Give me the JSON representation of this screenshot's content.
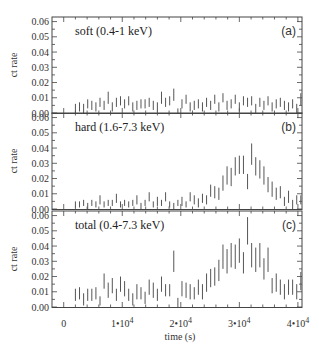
{
  "chart_data": {
    "type": "scatter",
    "style": "errorbar-lightcurve",
    "xlabel": "time (s)",
    "ylabel": "ct rate",
    "xlim": [
      -2000,
      40700
    ],
    "ylim": [
      0.0,
      0.063
    ],
    "x_ticks": [
      {
        "value": 0,
        "label": "0"
      },
      {
        "value": 10000,
        "label": "1•10",
        "exp": "4"
      },
      {
        "value": 20000,
        "label": "2•10",
        "exp": "4"
      },
      {
        "value": 30000,
        "label": "3•10",
        "exp": "4"
      },
      {
        "value": 40000,
        "label": "4•10",
        "exp": "4"
      }
    ],
    "y_ticks": [
      "0.00",
      "0.01",
      "0.02",
      "0.03",
      "0.04",
      "0.05",
      "0.06"
    ],
    "grid": false,
    "panels": [
      {
        "id": "a",
        "tag": "(a)",
        "title": "soft (0.4-1 keV)",
        "x": [
          2000,
          2700,
          3400,
          4100,
          4800,
          5500,
          6200,
          6900,
          7600,
          8300,
          9000,
          9700,
          10400,
          11100,
          11800,
          12500,
          13200,
          13900,
          14600,
          15300,
          16000,
          16700,
          17400,
          18100,
          18800,
          19500,
          20200,
          20900,
          21600,
          22300,
          23000,
          23700,
          24400,
          25100,
          25800,
          26500,
          27200,
          27900,
          28600,
          29300,
          30000,
          30700,
          31400,
          32100,
          32800,
          33500,
          34200,
          34900,
          35600,
          36300,
          37000,
          37700,
          38400,
          39100,
          39800,
          40500
        ],
        "y": [
          0.003,
          0.004,
          0.003,
          0.006,
          0.005,
          0.004,
          0.007,
          0.005,
          0.01,
          0.004,
          0.007,
          0.008,
          0.006,
          0.008,
          0.004,
          0.005,
          0.006,
          0.006,
          0.007,
          0.005,
          0.004,
          0.01,
          0.007,
          0.008,
          0.012,
          0.001,
          0.006,
          0.009,
          0.004,
          0.005,
          0.006,
          0.004,
          0.007,
          0.005,
          0.009,
          0.004,
          0.01,
          0.005,
          0.006,
          0.009,
          0.004,
          0.008,
          0.007,
          0.008,
          0.003,
          0.007,
          0.005,
          0.008,
          0.004,
          0.006,
          0.007,
          0.005,
          0.004,
          0.006,
          0.003,
          0.009
        ],
        "err": [
          0.003,
          0.003,
          0.003,
          0.003,
          0.003,
          0.003,
          0.003,
          0.003,
          0.004,
          0.003,
          0.003,
          0.003,
          0.003,
          0.003,
          0.003,
          0.003,
          0.003,
          0.003,
          0.003,
          0.003,
          0.003,
          0.004,
          0.003,
          0.003,
          0.004,
          0.002,
          0.003,
          0.003,
          0.003,
          0.003,
          0.003,
          0.003,
          0.003,
          0.003,
          0.003,
          0.003,
          0.003,
          0.003,
          0.003,
          0.003,
          0.003,
          0.003,
          0.003,
          0.003,
          0.003,
          0.003,
          0.003,
          0.003,
          0.003,
          0.003,
          0.003,
          0.003,
          0.003,
          0.003,
          0.003,
          0.004
        ]
      },
      {
        "id": "b",
        "tag": "(b)",
        "title": "hard (1.6-7.3 keV)",
        "x": [
          2000,
          2700,
          3400,
          4100,
          4800,
          5500,
          6200,
          6900,
          7600,
          8300,
          9000,
          9700,
          10400,
          11100,
          11800,
          12500,
          13200,
          13900,
          14600,
          15300,
          16000,
          16700,
          17400,
          18100,
          18800,
          19500,
          20200,
          20900,
          21600,
          22300,
          23000,
          23700,
          24400,
          25100,
          25800,
          26500,
          27200,
          27900,
          28600,
          29300,
          30000,
          30700,
          31400,
          32100,
          32800,
          33500,
          34200,
          34900,
          35600,
          36300,
          37000,
          37700,
          38400,
          39100,
          39800,
          40500
        ],
        "y": [
          0.003,
          0.003,
          0.004,
          0.002,
          0.004,
          0.003,
          0.006,
          0.003,
          0.004,
          0.004,
          0.007,
          0.003,
          0.004,
          0.003,
          0.004,
          0.006,
          0.002,
          0.004,
          0.008,
          0.003,
          0.005,
          0.004,
          0.008,
          0.003,
          0.002,
          0.004,
          0.005,
          0.003,
          0.008,
          0.006,
          0.004,
          0.007,
          0.006,
          0.012,
          0.011,
          0.01,
          0.017,
          0.022,
          0.021,
          0.028,
          0.029,
          0.029,
          0.018,
          0.036,
          0.028,
          0.026,
          0.022,
          0.016,
          0.013,
          0.01,
          0.011,
          0.005,
          0.008,
          0.003,
          0.006,
          0.006
        ],
        "err": [
          0.002,
          0.002,
          0.002,
          0.002,
          0.002,
          0.002,
          0.003,
          0.002,
          0.002,
          0.002,
          0.003,
          0.002,
          0.002,
          0.002,
          0.002,
          0.003,
          0.002,
          0.002,
          0.003,
          0.002,
          0.003,
          0.002,
          0.003,
          0.002,
          0.002,
          0.002,
          0.003,
          0.002,
          0.003,
          0.003,
          0.003,
          0.003,
          0.003,
          0.004,
          0.004,
          0.004,
          0.005,
          0.006,
          0.006,
          0.006,
          0.006,
          0.006,
          0.005,
          0.007,
          0.006,
          0.006,
          0.006,
          0.005,
          0.005,
          0.004,
          0.004,
          0.003,
          0.004,
          0.003,
          0.003,
          0.003
        ]
      },
      {
        "id": "c",
        "tag": "(c)",
        "title": "total (0.4-7.3 keV)",
        "x": [
          2000,
          2700,
          3400,
          4100,
          4800,
          5500,
          6200,
          6900,
          7600,
          8300,
          9000,
          9700,
          10400,
          11100,
          11800,
          12500,
          13200,
          13900,
          14600,
          15300,
          16000,
          16700,
          17400,
          18100,
          18800,
          19500,
          20200,
          20900,
          21600,
          22300,
          23000,
          23700,
          24400,
          25100,
          25800,
          26500,
          27200,
          27900,
          28600,
          29300,
          30000,
          30700,
          31400,
          32100,
          32800,
          33500,
          34200,
          34900,
          35600,
          36300,
          37000,
          37700,
          38400,
          39100,
          39800,
          40500
        ],
        "y": [
          0.008,
          0.009,
          0.005,
          0.008,
          0.008,
          0.009,
          0.004,
          0.017,
          0.011,
          0.014,
          0.008,
          0.015,
          0.012,
          0.008,
          0.005,
          0.01,
          0.009,
          0.006,
          0.013,
          0.011,
          0.008,
          0.015,
          0.011,
          0.011,
          0.03,
          0.003,
          0.012,
          0.011,
          0.01,
          0.009,
          0.013,
          0.01,
          0.016,
          0.019,
          0.02,
          0.024,
          0.033,
          0.03,
          0.034,
          0.033,
          0.037,
          0.029,
          0.05,
          0.034,
          0.031,
          0.034,
          0.025,
          0.031,
          0.014,
          0.016,
          0.013,
          0.01,
          0.013,
          0.013,
          0.01,
          0.017
        ],
        "err": [
          0.004,
          0.004,
          0.004,
          0.004,
          0.004,
          0.004,
          0.003,
          0.005,
          0.005,
          0.005,
          0.004,
          0.005,
          0.005,
          0.004,
          0.004,
          0.005,
          0.004,
          0.004,
          0.005,
          0.005,
          0.004,
          0.005,
          0.004,
          0.004,
          0.007,
          0.003,
          0.005,
          0.005,
          0.005,
          0.004,
          0.005,
          0.005,
          0.006,
          0.006,
          0.006,
          0.007,
          0.008,
          0.008,
          0.008,
          0.008,
          0.008,
          0.007,
          0.009,
          0.008,
          0.008,
          0.008,
          0.007,
          0.008,
          0.005,
          0.006,
          0.005,
          0.005,
          0.005,
          0.005,
          0.005,
          0.006
        ]
      }
    ]
  },
  "labels": {
    "xlabel": "time (s)",
    "ylabel": "ct rate"
  }
}
